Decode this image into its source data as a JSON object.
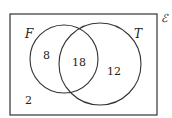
{
  "diagram": {
    "type": "venn",
    "universal_label": "ℰ",
    "sets": [
      {
        "name": "F",
        "only": "8"
      },
      {
        "name": "T",
        "only": "12"
      }
    ],
    "intersection": "18",
    "outside": "2"
  }
}
